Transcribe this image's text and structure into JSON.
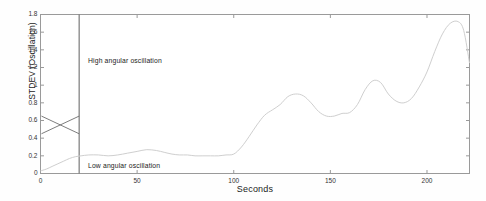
{
  "chart_data": {
    "type": "line",
    "title": "",
    "xlabel": "Seconds",
    "ylabel": "STDEV (Oscillation)",
    "xlim": [
      0,
      222
    ],
    "ylim": [
      0,
      1.8
    ],
    "grid": false,
    "legend": null,
    "xticks": [
      "0",
      "50",
      "100",
      "150",
      "200"
    ],
    "xtick_values": [
      0,
      50,
      100,
      150,
      200
    ],
    "yticks": [
      "0",
      "0.2",
      "0.4",
      "0.6",
      "0.8",
      "1",
      "1.2",
      "1.4",
      "1.6",
      "1.8"
    ],
    "ytick_values": [
      0,
      0.2,
      0.4,
      0.6,
      0.8,
      1.0,
      1.2,
      1.4,
      1.6,
      1.8
    ],
    "series": [
      {
        "name": "STDEV (Oscillation)",
        "color": "#cfcfcf",
        "x": [
          0,
          3,
          6,
          9,
          12,
          15,
          18,
          21,
          25,
          30,
          35,
          40,
          45,
          50,
          55,
          60,
          64,
          68,
          72,
          76,
          80,
          84,
          88,
          92,
          96,
          100,
          104,
          108,
          112,
          116,
          120,
          124,
          128,
          132,
          136,
          140,
          144,
          148,
          152,
          156,
          160,
          164,
          168,
          172,
          176,
          180,
          184,
          188,
          192,
          196,
          200,
          204,
          208,
          212,
          216,
          219,
          222
        ],
        "y": [
          0.03,
          0.05,
          0.08,
          0.11,
          0.14,
          0.17,
          0.19,
          0.2,
          0.21,
          0.21,
          0.2,
          0.21,
          0.23,
          0.25,
          0.27,
          0.26,
          0.24,
          0.22,
          0.21,
          0.21,
          0.2,
          0.2,
          0.2,
          0.2,
          0.21,
          0.22,
          0.3,
          0.42,
          0.55,
          0.66,
          0.72,
          0.78,
          0.87,
          0.9,
          0.88,
          0.8,
          0.7,
          0.65,
          0.65,
          0.68,
          0.69,
          0.78,
          0.95,
          1.05,
          1.03,
          0.9,
          0.82,
          0.8,
          0.85,
          0.98,
          1.15,
          1.38,
          1.58,
          1.7,
          1.72,
          1.62,
          1.25
        ]
      }
    ],
    "annotations": [
      {
        "text": "High angular oscillation",
        "x": 24,
        "y": 1.3
      },
      {
        "text": "Low angular oscillation",
        "x": 24,
        "y": 0.13
      }
    ],
    "markers": {
      "divider_line": {
        "x": 20,
        "y_from": 0,
        "y_to": 1.8,
        "color": "#6e6e6e"
      },
      "bowtie": {
        "x_from": 0.5,
        "x_to": 20,
        "y_low": 0.45,
        "y_high": 0.65,
        "color": "#6e6e6e"
      }
    }
  },
  "axis": {
    "ylabel": "STDEV (Oscillation)",
    "xlabel": "Seconds"
  }
}
